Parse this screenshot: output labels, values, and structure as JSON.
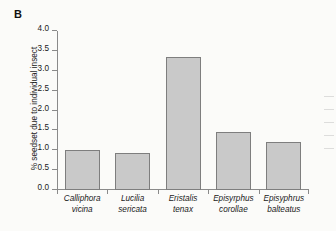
{
  "panel": {
    "label": "B"
  },
  "chart_data": {
    "type": "bar",
    "title": "",
    "xlabel": "",
    "ylabel": "% seedset due to individual insect",
    "ylim": [
      0,
      4.0
    ],
    "ytick_interval": 0.5,
    "grid": false,
    "legend": null,
    "categories": [
      "Calliphora vicina",
      "Lucilia sericata",
      "Eristalis tenax",
      "Episyrphus corollae",
      "Episyphrus balteatus"
    ],
    "category_lines": [
      [
        "Calliphora",
        "vicina"
      ],
      [
        "Lucilia",
        "sericata"
      ],
      [
        "Eristalis",
        "tenax"
      ],
      [
        "Episyrphus",
        "corollae"
      ],
      [
        "Episyphrus",
        "balteatus"
      ]
    ],
    "values": [
      1.0,
      0.93,
      3.35,
      1.45,
      1.22
    ],
    "ytick_labels": [
      "0.0",
      "0.5",
      "1.0",
      "1.5",
      "2.0",
      "2.5",
      "3.0",
      "3.5",
      "4.0"
    ],
    "ytick_values": [
      0.0,
      0.5,
      1.0,
      1.5,
      2.0,
      2.5,
      3.0,
      3.5,
      4.0
    ],
    "bar_fill_color": "#c9c9c9",
    "bar_border_color": "#7e7e7e",
    "axis_color": "#8a8a8a",
    "background_color": "#fbfbf9"
  }
}
